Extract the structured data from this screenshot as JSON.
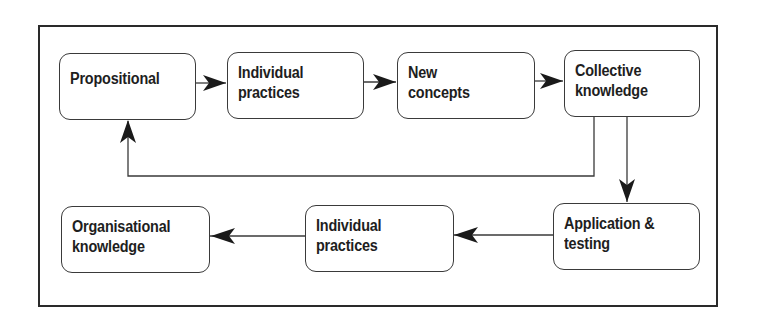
{
  "diagram": {
    "type": "flowchart",
    "nodes": [
      {
        "id": "n1",
        "line1": "Propositional",
        "line2": ""
      },
      {
        "id": "n2",
        "line1": "Individual",
        "line2": "practices"
      },
      {
        "id": "n3",
        "line1": "New",
        "line2": "concepts"
      },
      {
        "id": "n4",
        "line1": "Collective",
        "line2": "knowledge"
      },
      {
        "id": "n5",
        "line1": "Application &",
        "line2": "testing"
      },
      {
        "id": "n6",
        "line1": "Individual",
        "line2": "practices"
      },
      {
        "id": "n7",
        "line1": "Organisational",
        "line2": "knowledge"
      }
    ],
    "edges": [
      {
        "from": "n1",
        "to": "n2"
      },
      {
        "from": "n2",
        "to": "n3"
      },
      {
        "from": "n3",
        "to": "n4"
      },
      {
        "from": "n4",
        "to": "n1"
      },
      {
        "from": "n4",
        "to": "n5"
      },
      {
        "from": "n5",
        "to": "n6"
      },
      {
        "from": "n6",
        "to": "n7"
      }
    ],
    "colors": {
      "stroke": "#2a2a2a",
      "text": "#1e1e1e",
      "background": "#ffffff"
    }
  }
}
